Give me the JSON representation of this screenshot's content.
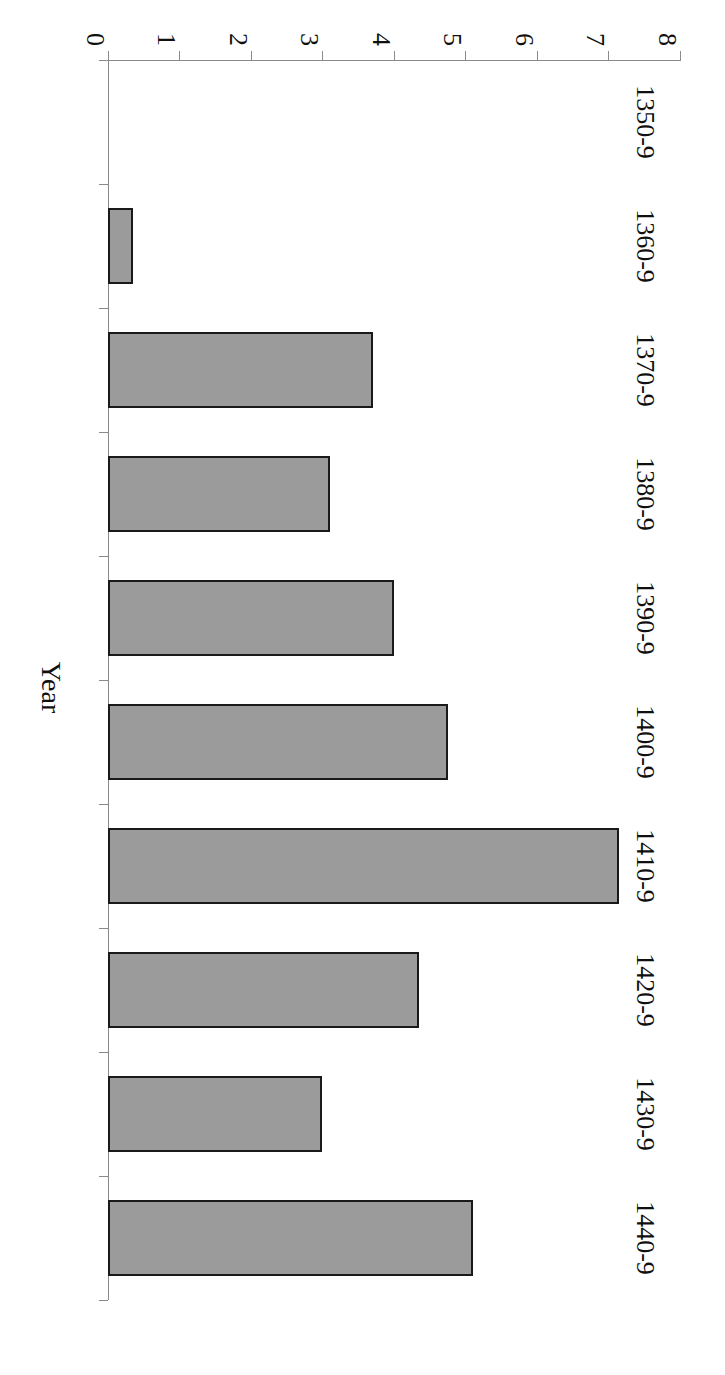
{
  "chart_data": {
    "type": "bar",
    "title": "",
    "subtitle": "",
    "xlabel": "Year",
    "ylabel": "",
    "orientation": "vertical-bars-on-rotated-page",
    "grid": false,
    "legend": null,
    "categories": [
      "1350-9",
      "1360-9",
      "1370-9",
      "1380-9",
      "1390-9",
      "1400-9",
      "1410-9",
      "1420-9",
      "1430-9",
      "1440-9"
    ],
    "values": [
      0,
      0.35,
      3.7,
      3.1,
      4.0,
      4.75,
      7.15,
      4.35,
      3.0,
      5.1
    ],
    "ylim": [
      0,
      8
    ],
    "ytick_labels": [
      "0",
      "1",
      "2",
      "3",
      "4",
      "5",
      "6",
      "7",
      "8"
    ],
    "ytick_values": [
      0,
      1,
      2,
      3,
      4,
      5,
      6,
      7,
      8
    ],
    "bar_fill_color": "#9b9b9b",
    "bar_edge_color": "#1a1a1a",
    "axis_color": "#8a8a8a",
    "background_color": "#ffffff"
  }
}
